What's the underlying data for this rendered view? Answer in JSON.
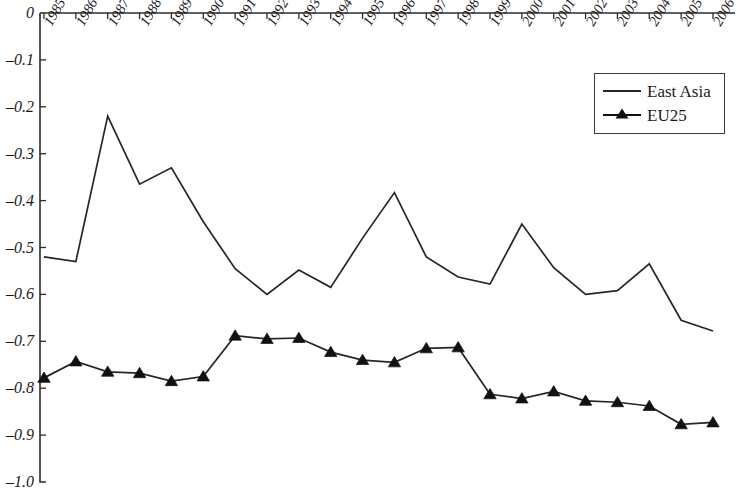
{
  "chart_data": {
    "type": "line",
    "title": "",
    "subtitle": "",
    "xlabel": "",
    "ylabel": "",
    "grid": false,
    "legend_position": "top-right",
    "ylim": [
      -1.0,
      0.0
    ],
    "ytick_labels": [
      "0",
      "–0.1",
      "–0.2",
      "–0.3",
      "–0.4",
      "–0.5",
      "–0.6",
      "–0.7",
      "–0.8",
      "–0.9",
      "–1.0"
    ],
    "ytick_values": [
      0,
      -0.1,
      -0.2,
      -0.3,
      -0.4,
      -0.5,
      -0.6,
      -0.7,
      -0.8,
      -0.9,
      -1.0
    ],
    "categories": [
      "1985",
      "1986",
      "1987",
      "1988",
      "1989",
      "1990",
      "1991",
      "1992",
      "1993",
      "1994",
      "1995",
      "1996",
      "1997",
      "1998",
      "1999",
      "2000",
      "2001",
      "2002",
      "2003",
      "2004",
      "2005",
      "2006"
    ],
    "series": [
      {
        "name": "East Asia",
        "marker": "none",
        "color": "#262626",
        "values": [
          -0.52,
          -0.53,
          -0.22,
          -0.365,
          -0.33,
          -0.445,
          -0.545,
          -0.6,
          -0.548,
          -0.585,
          -0.48,
          -0.383,
          -0.52,
          -0.563,
          -0.578,
          -0.45,
          -0.543,
          -0.6,
          -0.592,
          -0.535,
          -0.655,
          -0.678
        ]
      },
      {
        "name": "EU25",
        "marker": "triangle",
        "color": "#111111",
        "values": [
          -0.778,
          -0.743,
          -0.765,
          -0.768,
          -0.785,
          -0.775,
          -0.688,
          -0.695,
          -0.693,
          -0.723,
          -0.74,
          -0.745,
          -0.715,
          -0.713,
          -0.813,
          -0.822,
          -0.807,
          -0.827,
          -0.83,
          -0.838,
          -0.877,
          -0.873
        ]
      }
    ]
  },
  "legend": {
    "entries": [
      {
        "label": "East Asia",
        "marker": "line"
      },
      {
        "label": "EU25",
        "marker": "line-triangle"
      }
    ]
  }
}
